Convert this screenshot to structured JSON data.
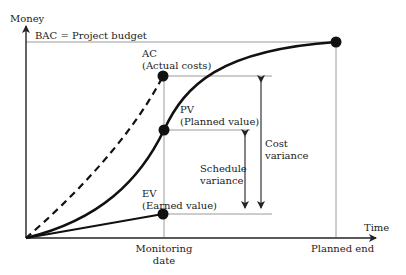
{
  "axes": {
    "y_label": "Money",
    "x_label": "Time"
  },
  "bac_label": "BAC = Project budget",
  "points": {
    "ac": {
      "abbr": "AC",
      "name": "(Actual costs)"
    },
    "pv": {
      "abbr": "PV",
      "name": "(Planned value)"
    },
    "ev": {
      "abbr": "EV",
      "name": "(Earned value)"
    }
  },
  "variances": {
    "schedule": {
      "line1": "Schedule",
      "line2": "variance"
    },
    "cost": {
      "line1": "Cost",
      "line2": "variance"
    }
  },
  "x_ticks": {
    "monitoring_line1": "Monitoring",
    "monitoring_line2": "date",
    "planned_end": "Planned end"
  },
  "colors": {
    "curve": "#111111",
    "guide": "#9a9a9a",
    "axis": "#222222"
  }
}
